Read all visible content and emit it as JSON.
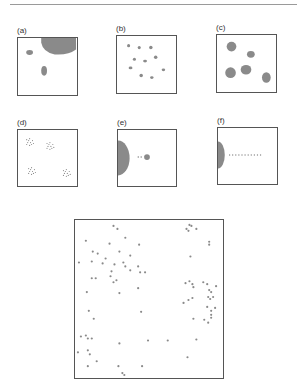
{
  "figure": {
    "colors": {
      "shape": "#8a8a8a",
      "border": "#555555",
      "rule": "#9a9a9a"
    },
    "panels": [
      {
        "label": "(a)",
        "desc": "Large blob in upper-right corner with two small ellipses",
        "box": [
          17,
          37,
          61,
          59
        ],
        "shapes": [
          {
            "type": "path",
            "d": "M24 0 L60 0 L60 12 Q52 18 38 17 Q26 15 24 5 Z"
          },
          {
            "type": "ellipse",
            "cx": 12,
            "cy": 15,
            "rx": 3.5,
            "ry": 2.5
          },
          {
            "type": "ellipse",
            "cx": 27,
            "cy": 34,
            "rx": 3,
            "ry": 5
          }
        ]
      },
      {
        "label": "(b)",
        "desc": "Ten small scattered dots",
        "box": [
          116,
          35,
          61,
          59
        ],
        "shapes": [
          {
            "type": "ellipse",
            "cx": 12,
            "cy": 10,
            "rx": 1.6,
            "ry": 1.6
          },
          {
            "type": "ellipse",
            "cx": 23,
            "cy": 12,
            "rx": 1.6,
            "ry": 1.6
          },
          {
            "type": "ellipse",
            "cx": 35,
            "cy": 12,
            "rx": 1.8,
            "ry": 1.8
          },
          {
            "type": "ellipse",
            "cx": 18,
            "cy": 24,
            "rx": 1.6,
            "ry": 1.6
          },
          {
            "type": "ellipse",
            "cx": 29,
            "cy": 26,
            "rx": 2,
            "ry": 1.4
          },
          {
            "type": "ellipse",
            "cx": 40,
            "cy": 22,
            "rx": 1.8,
            "ry": 1.8
          },
          {
            "type": "ellipse",
            "cx": 14,
            "cy": 33,
            "rx": 2,
            "ry": 1.4
          },
          {
            "type": "ellipse",
            "cx": 48,
            "cy": 35,
            "rx": 1.8,
            "ry": 1.4
          },
          {
            "type": "ellipse",
            "cx": 25,
            "cy": 41,
            "rx": 1.8,
            "ry": 1.8
          },
          {
            "type": "ellipse",
            "cx": 36,
            "cy": 43,
            "rx": 1.8,
            "ry": 1.4
          }
        ]
      },
      {
        "label": "(c)",
        "desc": "Five medium ellipses",
        "box": [
          216,
          34,
          61,
          59
        ],
        "shapes": [
          {
            "type": "ellipse",
            "cx": 15,
            "cy": 12,
            "rx": 5,
            "ry": 5
          },
          {
            "type": "ellipse",
            "cx": 35,
            "cy": 20,
            "rx": 4,
            "ry": 3.5
          },
          {
            "type": "ellipse",
            "cx": 14,
            "cy": 39,
            "rx": 5.5,
            "ry": 5.5
          },
          {
            "type": "ellipse",
            "cx": 30,
            "cy": 36,
            "rx": 5.5,
            "ry": 5
          },
          {
            "type": "ellipse",
            "cx": 51,
            "cy": 44,
            "rx": 4.5,
            "ry": 5.5
          }
        ]
      },
      {
        "label": "(d)",
        "desc": "Four tight clusters of tiny points",
        "box": [
          17,
          129,
          61,
          58
        ],
        "clusters": [
          [
            12,
            12
          ],
          [
            33,
            16
          ],
          [
            14,
            42
          ],
          [
            50,
            44
          ]
        ]
      },
      {
        "label": "(e)",
        "desc": "Half-disc on left edge, small dot with two tiny points",
        "box": [
          117,
          129,
          60,
          58
        ],
        "shapes": [
          {
            "type": "ellipse",
            "cx": 0,
            "cy": 29,
            "rx": 12,
            "ry": 18
          },
          {
            "type": "ellipse",
            "cx": 30,
            "cy": 28,
            "rx": 3,
            "ry": 3
          },
          {
            "type": "ellipse",
            "cx": 21,
            "cy": 28,
            "rx": 0.8,
            "ry": 0.8
          },
          {
            "type": "ellipse",
            "cx": 24,
            "cy": 28,
            "rx": 0.8,
            "ry": 0.8
          }
        ]
      },
      {
        "label": "(f)",
        "desc": "Half-disc on left edge with horizontal line of points",
        "box": [
          217,
          127,
          61,
          58
        ],
        "shapes": [
          {
            "type": "ellipse",
            "cx": 0,
            "cy": 28,
            "rx": 7,
            "ry": 14
          }
        ],
        "row": {
          "y": 28,
          "x0": 12,
          "x1": 44,
          "n": 11
        }
      }
    ],
    "main_panel": {
      "desc": "Large scatter of points forming loose clusters",
      "box": [
        74,
        219,
        150,
        160
      ],
      "points": [
        [
          39,
          6
        ],
        [
          43,
          9
        ],
        [
          11,
          21
        ],
        [
          35,
          24
        ],
        [
          51,
          18
        ],
        [
          65,
          25
        ],
        [
          18,
          32
        ],
        [
          23,
          34
        ],
        [
          31,
          39
        ],
        [
          45,
          32
        ],
        [
          56,
          36
        ],
        [
          17,
          42
        ],
        [
          28,
          44
        ],
        [
          40,
          45
        ],
        [
          49,
          43
        ],
        [
          4,
          43
        ],
        [
          37,
          52
        ],
        [
          51,
          47
        ],
        [
          64,
          47
        ],
        [
          56,
          51
        ],
        [
          66,
          53
        ],
        [
          71,
          53
        ],
        [
          36,
          57
        ],
        [
          17,
          59
        ],
        [
          21,
          59
        ],
        [
          39,
          63
        ],
        [
          42,
          61
        ],
        [
          64,
          69
        ],
        [
          12,
          73
        ],
        [
          45,
          74
        ],
        [
          14,
          92
        ],
        [
          67,
          93
        ],
        [
          19,
          100
        ],
        [
          6,
          118
        ],
        [
          11,
          117
        ],
        [
          13,
          120
        ],
        [
          17,
          120
        ],
        [
          45,
          125
        ],
        [
          74,
          122
        ],
        [
          94,
          122
        ],
        [
          3,
          134
        ],
        [
          13,
          132
        ],
        [
          15,
          136
        ],
        [
          22,
          143
        ],
        [
          13,
          148
        ],
        [
          44,
          148
        ],
        [
          68,
          148
        ],
        [
          48,
          155
        ],
        [
          50,
          157
        ],
        [
          116,
          5
        ],
        [
          113,
          9
        ],
        [
          115,
          11
        ],
        [
          118,
          6
        ],
        [
          123,
          9
        ],
        [
          136,
          22
        ],
        [
          136,
          25
        ],
        [
          117,
          37
        ],
        [
          112,
          64
        ],
        [
          116,
          62
        ],
        [
          119,
          65
        ],
        [
          120,
          68
        ],
        [
          130,
          63
        ],
        [
          134,
          65
        ],
        [
          143,
          67
        ],
        [
          136,
          71
        ],
        [
          138,
          73
        ],
        [
          140,
          78
        ],
        [
          135,
          78
        ],
        [
          137,
          80
        ],
        [
          110,
          84
        ],
        [
          115,
          81
        ],
        [
          119,
          79
        ],
        [
          134,
          88
        ],
        [
          138,
          92
        ],
        [
          138,
          96
        ],
        [
          138,
          99
        ],
        [
          142,
          89
        ],
        [
          120,
          100
        ],
        [
          131,
          101
        ],
        [
          135,
          104
        ],
        [
          123,
          121
        ],
        [
          106,
          161
        ],
        [
          114,
          139
        ]
      ]
    }
  }
}
